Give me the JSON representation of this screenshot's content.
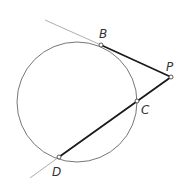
{
  "diagram": {
    "type": "geometry",
    "circle": {
      "cx": 77,
      "cy": 102,
      "r": 60
    },
    "points": {
      "B": {
        "label": "B",
        "x": 101,
        "y": 45
      },
      "P": {
        "label": "P",
        "x": 171,
        "y": 77
      },
      "C": {
        "label": "C",
        "x": 137,
        "y": 101
      },
      "D": {
        "label": "D",
        "x": 59,
        "y": 157
      }
    },
    "segments": [
      {
        "name": "tangent-PB",
        "from": "P",
        "to": "B",
        "bold": true
      },
      {
        "name": "secant-PD",
        "from": "P",
        "to": "D",
        "bold": true
      }
    ],
    "colors": {
      "line": "#1a1a1a",
      "thin": "#888888",
      "circle": "#666666"
    }
  }
}
